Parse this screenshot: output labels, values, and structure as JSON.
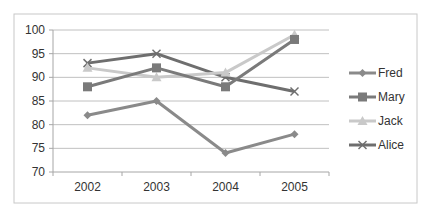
{
  "chart_data": {
    "type": "line",
    "title": "",
    "xlabel": "",
    "ylabel": "",
    "categories": [
      "2002",
      "2003",
      "2004",
      "2005"
    ],
    "ylim": [
      70,
      100
    ],
    "yticks": [
      70,
      75,
      80,
      85,
      90,
      95,
      100
    ],
    "grid": true,
    "legend_position": "right",
    "series": [
      {
        "name": "Fred",
        "values": [
          82,
          85,
          74,
          78
        ],
        "color": "#8a8a8a",
        "marker": "diamond"
      },
      {
        "name": "Mary",
        "values": [
          88,
          92,
          88,
          98
        ],
        "color": "#7a7a7a",
        "marker": "square"
      },
      {
        "name": "Jack",
        "values": [
          92,
          90,
          91,
          99
        ],
        "color": "#c9c9c9",
        "marker": "triangle"
      },
      {
        "name": "Alice",
        "values": [
          93,
          95,
          90,
          87
        ],
        "color": "#6e6e6e",
        "marker": "x"
      }
    ]
  },
  "colors": {
    "gridline": "#c0c0c0",
    "axis": "#a6a6a6",
    "border": "#bfbfbf"
  }
}
